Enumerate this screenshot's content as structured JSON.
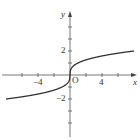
{
  "chart_data": {
    "type": "line",
    "title": "",
    "function": "y = cube root of x",
    "xlabel": "x",
    "ylabel": "y",
    "origin_label": "O",
    "xlim": [
      -8.5,
      8.2
    ],
    "ylim": [
      -5,
      5
    ],
    "x_tick_values": [
      -6,
      -4,
      -2,
      2,
      4,
      6
    ],
    "x_tick_labels": [
      {
        "value": -4,
        "label": "−4"
      },
      {
        "value": 4,
        "label": "4"
      }
    ],
    "y_tick_values": [
      -4,
      -3,
      -2,
      -1,
      1,
      2,
      3,
      4
    ],
    "y_tick_labels": [
      {
        "value": 2,
        "label": "2"
      },
      {
        "value": -2,
        "label": "−2"
      }
    ],
    "grid": false,
    "series": [
      {
        "name": "cube root",
        "x": [
          -8,
          -6,
          -4,
          -2,
          -1,
          -0.5,
          -0.1,
          0,
          0.1,
          0.5,
          1,
          2,
          4,
          6,
          8
        ],
        "y": [
          -2,
          -1.817,
          -1.587,
          -1.26,
          -1,
          -0.794,
          -0.464,
          0,
          0.464,
          0.794,
          1,
          1.26,
          1.587,
          1.817,
          2
        ]
      }
    ],
    "colors": {
      "axis": "#555555",
      "curve": "#333333"
    }
  },
  "labels": {
    "x_axis": "x",
    "y_axis": "y",
    "origin": "O",
    "x_neg4": "−4",
    "x_pos4": "4",
    "y_pos2": "2",
    "y_neg2": "−2"
  }
}
